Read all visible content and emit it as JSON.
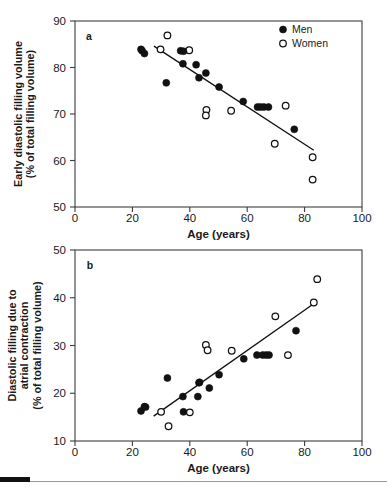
{
  "figure": {
    "background_color": "#ffffff",
    "ink_color": "#111111",
    "footer_rule_color": "#9a9a9a"
  },
  "legend": {
    "position": "top-right-panel-a",
    "entries": [
      {
        "label": "Men",
        "marker": "filled-circle"
      },
      {
        "label": "Women",
        "marker": "open-circle"
      }
    ]
  },
  "chart_data": [
    {
      "panel_letter": "a",
      "type": "scatter",
      "title": "",
      "xlabel": "Age (years)",
      "ylabel": "Early diastolic filling volume\n(% of total filling volume)",
      "ylabel_lines": [
        "Early diastolic filling volume",
        "(% of total filling volume)"
      ],
      "xlim": [
        0,
        100
      ],
      "ylim": [
        50,
        90
      ],
      "xticks": [
        0,
        20,
        40,
        60,
        80,
        100
      ],
      "yticks": [
        50,
        60,
        70,
        80,
        90
      ],
      "grid": false,
      "series": [
        {
          "name": "Men",
          "marker": "filled-circle",
          "points": [
            [
              23,
              83.9
            ],
            [
              23.4,
              83.6
            ],
            [
              24.2,
              83.0
            ],
            [
              31.8,
              76.7
            ],
            [
              36.8,
              83.6
            ],
            [
              37.8,
              83.5
            ],
            [
              37.6,
              80.8
            ],
            [
              42.2,
              80.6
            ],
            [
              43.2,
              77.8
            ],
            [
              45.6,
              78.8
            ],
            [
              50.2,
              75.8
            ],
            [
              58.6,
              72.7
            ],
            [
              63.6,
              71.5
            ],
            [
              64.6,
              71.5
            ],
            [
              65.8,
              71.5
            ],
            [
              67.4,
              71.5
            ],
            [
              76.4,
              66.7
            ]
          ]
        },
        {
          "name": "Women",
          "marker": "open-circle",
          "points": [
            [
              32.2,
              86.9
            ],
            [
              29.8,
              83.9
            ],
            [
              39.8,
              83.7
            ],
            [
              45.8,
              70.9
            ],
            [
              45.6,
              69.7
            ],
            [
              54.4,
              70.7
            ],
            [
              73.4,
              71.8
            ],
            [
              69.6,
              63.6
            ],
            [
              82.8,
              60.7
            ],
            [
              82.8,
              55.9
            ]
          ]
        }
      ],
      "fit_line": {
        "kind": "linear-regression",
        "x_start": 27.5,
        "y_start": 84.6,
        "x_end": 83.2,
        "y_end": 62.2,
        "slope": -0.402,
        "intercept": 95.7
      }
    },
    {
      "panel_letter": "b",
      "type": "scatter",
      "title": "",
      "xlabel": "Age (years)",
      "ylabel": "Diastolic filling due to\natrial contraction\n(% of total filling volume)",
      "ylabel_lines": [
        "Diastolic filling due to",
        "atrial contraction",
        "(% of total filling volume)"
      ],
      "xlim": [
        0,
        100
      ],
      "ylim": [
        10,
        50
      ],
      "xticks": [
        0,
        20,
        40,
        60,
        80,
        100
      ],
      "yticks": [
        10,
        20,
        30,
        40,
        50
      ],
      "grid": false,
      "series": [
        {
          "name": "Men",
          "marker": "filled-circle",
          "points": [
            [
              23.0,
              16.3
            ],
            [
              24.2,
              17.2
            ],
            [
              24.6,
              17.1
            ],
            [
              32.2,
              23.2
            ],
            [
              37.6,
              19.3
            ],
            [
              37.8,
              16.1
            ],
            [
              42.8,
              19.3
            ],
            [
              43.2,
              22.2
            ],
            [
              43.4,
              22.3
            ],
            [
              46.8,
              21.1
            ],
            [
              50.2,
              23.9
            ],
            [
              58.8,
              27.2
            ],
            [
              63.4,
              28.0
            ],
            [
              65.4,
              28.0
            ],
            [
              66.6,
              28.0
            ],
            [
              67.6,
              28.0
            ],
            [
              77.0,
              33.1
            ]
          ]
        },
        {
          "name": "Women",
          "marker": "open-circle",
          "points": [
            [
              30.0,
              16.1
            ],
            [
              32.6,
              13.1
            ],
            [
              40.0,
              16.0
            ],
            [
              45.6,
              30.1
            ],
            [
              46.2,
              29.0
            ],
            [
              54.6,
              28.9
            ],
            [
              69.8,
              36.1
            ],
            [
              74.2,
              28.0
            ],
            [
              83.2,
              39.0
            ],
            [
              84.4,
              43.9
            ]
          ]
        }
      ],
      "fit_line": {
        "kind": "linear-regression",
        "x_start": 27.4,
        "y_start": 15.2,
        "x_end": 82.8,
        "y_end": 38.6,
        "slope": 0.422,
        "intercept": 3.6
      }
    }
  ]
}
